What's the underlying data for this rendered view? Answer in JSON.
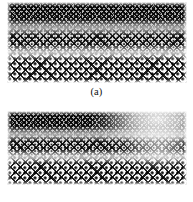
{
  "figure": {
    "background_color": "#ffffff",
    "width": 193,
    "height": 202
  },
  "panels": [
    {
      "id": "panel-a",
      "caption": "(a)",
      "image_alt": "woven diamond-lattice wire mesh, evenly illuminated",
      "mesh_description": "diamond lattice weave with beaded crossing nodes, denser toward top due to perspective",
      "ink_color": "#141414",
      "background_color": "#fdfdfd",
      "exposure": "even"
    },
    {
      "id": "panel-b",
      "caption": "(b)",
      "image_alt": "woven diamond-lattice wire mesh with overexposed bright region at upper right",
      "mesh_description": "diamond lattice weave with beaded crossing nodes, washed-out highlight in upper-right quadrant",
      "ink_color": "#141414",
      "background_color": "#fdfdfd",
      "exposure": "uneven, blown-out upper right",
      "highlight_color": "#ffffff"
    }
  ]
}
